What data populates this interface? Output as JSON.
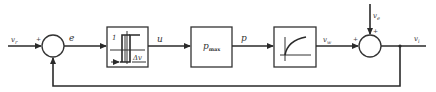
{
  "diagram": {
    "type": "feedback control block diagram",
    "signals": {
      "reference": "v_r",
      "reference_main": "v",
      "reference_sub": "r",
      "error": "e",
      "control": "u",
      "power": "p",
      "process_output": "v_w",
      "process_main": "v",
      "process_sub": "w",
      "disturbance": "v_e",
      "disturbance_main": "v",
      "disturbance_sub": "e",
      "output": "v_i",
      "output_main": "v",
      "output_sub": "i"
    },
    "summing_junctions": [
      {
        "id": "sum1",
        "signs": {
          "left": "+",
          "bottom": "−"
        }
      },
      {
        "id": "sum2",
        "signs": {
          "left": "+",
          "top": "+"
        }
      }
    ],
    "blocks": [
      {
        "id": "relay",
        "description": "hysteresis relay",
        "label_level": "1",
        "label_width": "Δv"
      },
      {
        "id": "gain",
        "label_main": "p",
        "label_sub": "max"
      },
      {
        "id": "process",
        "description": "first-order lag response curve"
      }
    ],
    "colors": {
      "line": "#2a2a2a",
      "background": "#ffffff"
    }
  }
}
